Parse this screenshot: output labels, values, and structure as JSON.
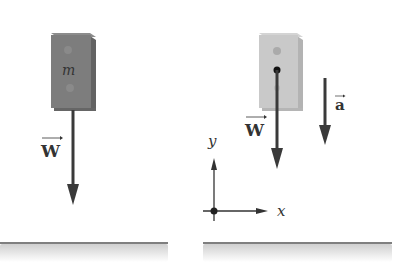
{
  "diagram": {
    "left_panel": {
      "block_label": "m",
      "force_label": "W",
      "block_color": "#7d7d7d",
      "block_side_color": "#6a6a6a"
    },
    "right_panel": {
      "force_label": "W",
      "acceleration_label": "a",
      "axis_x_label": "x",
      "axis_y_label": "y",
      "block_color": "#c9c9c9",
      "block_side_color": "#b3b3b3"
    },
    "colors": {
      "arrow": "#3a3a3a",
      "ground_line": "#555555",
      "ground_shadow": "#d6d6d6"
    }
  }
}
